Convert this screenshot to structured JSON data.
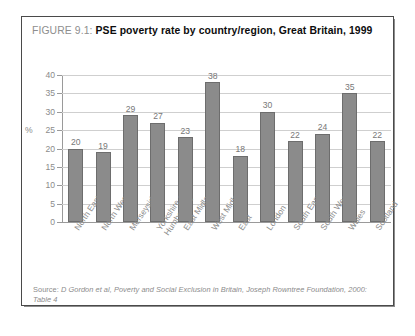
{
  "caption": {
    "figure_number": "FIGURE 9.1:",
    "title": "PSE poverty rate by country/region, Great Britain, 1999"
  },
  "source": {
    "label": "Source:",
    "text": " D Gordon et al, Poverty and Social Exclusion in Britain, Joseph Rowntree Foundation, 2000: Table 4"
  },
  "axis": {
    "unit_label": "%",
    "tick_labels": [
      "40",
      "35",
      "30",
      "25",
      "20",
      "15",
      "10",
      "5",
      "0"
    ]
  },
  "colors": {
    "bar_fill": "#8b8b8b",
    "bar_stroke": "#6d6d6d",
    "gridline": "#cfcfcf",
    "axis": "#9a9a9a",
    "label_text": "#8b8b8b",
    "caption_figure": "#8e8e8e",
    "caption_title": "#0d0d0d",
    "frame": "#4a4a4a"
  },
  "chart_data": {
    "type": "bar",
    "title": "PSE poverty rate by country/region, Great Britain, 1999",
    "xlabel": "",
    "ylabel": "%",
    "ylim": [
      0,
      40
    ],
    "ytick_step": 5,
    "grid": true,
    "legend": null,
    "categories": [
      "North East",
      "North West",
      "Merseyside",
      "Yorkshire and Humberside",
      "East Midlands",
      "West Midlands",
      "East",
      "London",
      "South East",
      "South West",
      "Wales",
      "Scotland"
    ],
    "values": [
      20,
      19,
      29,
      27,
      23,
      38,
      18,
      30,
      22,
      24,
      35,
      22
    ],
    "value_labels": [
      "20",
      "19",
      "29",
      "27",
      "23",
      "38",
      "18",
      "30",
      "22",
      "24",
      "35",
      "22"
    ]
  }
}
